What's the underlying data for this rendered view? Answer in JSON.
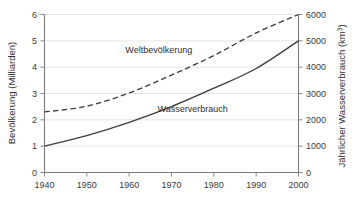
{
  "chart_data": {
    "type": "line",
    "title": "",
    "xlabel": "",
    "x": [
      1940,
      1950,
      1960,
      1970,
      1980,
      1990,
      2000
    ],
    "xlim": [
      1940,
      2000
    ],
    "xticks": [
      "1940",
      "1950",
      "1960",
      "1970",
      "1980",
      "1990",
      "2000"
    ],
    "grid": true,
    "legend_position": "inline-annotations",
    "axes": [
      {
        "side": "left",
        "label": "Bevölkerung (Milliarden)",
        "ylim": [
          0,
          6
        ],
        "yticks": [
          "0",
          "1",
          "2",
          "3",
          "4",
          "5",
          "6"
        ]
      },
      {
        "side": "right",
        "label": "Jährlicher Wasserverbrauch (km³)",
        "label_base": "Jährlicher Wasserverbrauch (km",
        "label_sup": "3",
        "label_tail": ")",
        "ylim": [
          0,
          6000
        ],
        "yticks": [
          "0",
          "1000",
          "2000",
          "3000",
          "4000",
          "5000",
          "6000"
        ]
      }
    ],
    "series": [
      {
        "name": "Weltbevölkerung",
        "axis": "left",
        "style": "dashed",
        "color": "#3d3d3d",
        "unit": "Milliarden",
        "values": [
          2.3,
          2.52,
          3.02,
          3.7,
          4.44,
          5.3,
          6.0
        ],
        "annotation": {
          "text": "Weltbevölkerung",
          "x": 1967,
          "y": 4.55
        }
      },
      {
        "name": "Wasserverbrauch",
        "axis": "right",
        "style": "solid",
        "color": "#3d3d3d",
        "unit": "km³",
        "values": [
          1000,
          1400,
          1900,
          2500,
          3200,
          3950,
          5000
        ],
        "annotation": {
          "text": "Wasserverbrauch",
          "x": 1975,
          "y": 2300
        }
      }
    ]
  },
  "colors": {
    "grid": "#e2e2e2",
    "axis": "#7b7b7b",
    "line": "#3d3d3d",
    "text": "#2e2e2e",
    "background": "#ffffff"
  }
}
